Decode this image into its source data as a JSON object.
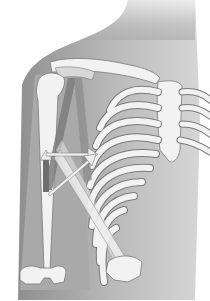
{
  "image": {
    "subject": "Anatomical illustration of right shoulder, humerus, forearm and rib cage with muscle bands and motion arrows",
    "colors": {
      "background": "#ffffff",
      "skin_shadow": "#9a9a9a",
      "body_fill": "#b5b5b5",
      "bone": "#f2f2f2",
      "bone_outline": "#7a7a7a",
      "muscle": "#7c7c7c",
      "arrow": "#e8e8e8",
      "intercostal": "#a0a0a0"
    },
    "arrows": [
      {
        "name": "horizontal-arrow",
        "direction": "right"
      },
      {
        "name": "diagonal-arrow",
        "direction": "up-right"
      },
      {
        "name": "vertical-arrow",
        "direction": "up"
      }
    ]
  }
}
